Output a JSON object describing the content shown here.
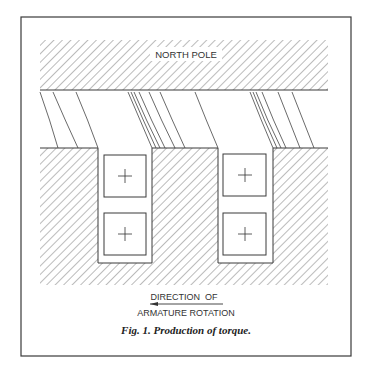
{
  "figure": {
    "pole_label": "NORTH POLE",
    "direction_line1": "DIRECTION  OF",
    "direction_line2": "ARMATURE ROTATION",
    "caption": "Fig. 1. Production of torque.",
    "direction_arrow": "left-arrow",
    "conductor_symbol": "+",
    "slots": [
      {
        "conductors": [
          "+",
          "+"
        ]
      },
      {
        "conductors": [
          "+",
          "+"
        ]
      }
    ],
    "colors": {
      "line": "#3a3a3a",
      "background": "#ffffff",
      "hatch": "#555555"
    }
  }
}
